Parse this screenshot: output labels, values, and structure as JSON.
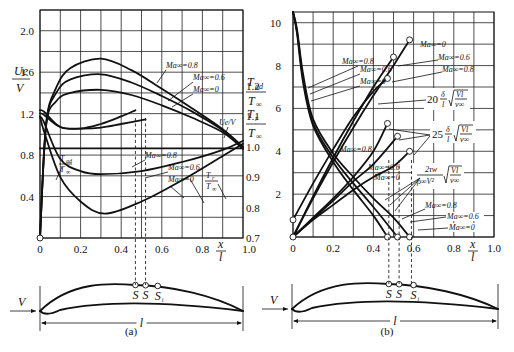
{
  "figure": {
    "panel_a_caption": "(a)",
    "panel_b_caption": "(b)",
    "airfoil": {
      "velocity_label": "V",
      "chord_label": "l",
      "point_labels": [
        "S",
        "S",
        "Sᵢ"
      ]
    }
  },
  "chart_data": [
    {
      "id": "a",
      "type": "line",
      "title": "",
      "xlabel": "x/l",
      "ylabel_left": "Ue/V",
      "ylabel_right": [
        "T_ad/T_∞",
        "T_r/T_∞"
      ],
      "xlim": [
        0,
        1.0
      ],
      "ylim_left": [
        0,
        2.2
      ],
      "ylim_right": [
        0.7,
        1.45
      ],
      "grid": true,
      "x_ticks": [
        "0",
        "0.2",
        "0.4",
        "0.6",
        "0.8",
        "1.0"
      ],
      "y_ticks_left": [
        "0.4",
        "0.8",
        "1.2",
        "1.6",
        "2.0"
      ],
      "y_ticks_right": [
        "0.7",
        "0.8",
        "0.9",
        "1.0",
        "1.1",
        "1.2"
      ],
      "series": [
        {
          "name": "Ue/V, Ma∞=0.8",
          "axis": "left",
          "x": [
            0,
            0.03,
            0.08,
            0.15,
            0.3,
            0.45,
            0.6,
            0.75,
            0.9,
            1.0
          ],
          "y": [
            0,
            1.1,
            1.45,
            1.64,
            1.73,
            1.62,
            1.44,
            1.25,
            1.05,
            0.88
          ]
        },
        {
          "name": "Ue/V, Ma∞=0.6",
          "axis": "left",
          "x": [
            0,
            0.03,
            0.08,
            0.15,
            0.3,
            0.45,
            0.6,
            0.75,
            0.9,
            1.0
          ],
          "y": [
            0,
            1.1,
            1.4,
            1.53,
            1.58,
            1.5,
            1.37,
            1.22,
            1.04,
            0.87
          ]
        },
        {
          "name": "Ue/V, Ma∞=0",
          "axis": "left",
          "x": [
            0,
            0.03,
            0.08,
            0.15,
            0.3,
            0.45,
            0.6,
            0.75,
            0.9,
            1.0
          ],
          "y": [
            0,
            1.08,
            1.32,
            1.4,
            1.43,
            1.38,
            1.28,
            1.16,
            1.02,
            0.86
          ]
        },
        {
          "name": "T_ad/T∞, Ma∞=0.8",
          "axis": "right",
          "x": [
            0,
            0.02,
            0.1,
            0.2,
            0.3,
            0.4,
            0.47
          ],
          "y": [
            1.12,
            1.115,
            1.065,
            1.06,
            1.075,
            1.1,
            1.12
          ]
        },
        {
          "name": "T_ad/T∞, Ma∞=0.6",
          "axis": "right",
          "x": [
            0,
            0.02,
            0.1,
            0.2,
            0.3,
            0.4,
            0.52
          ],
          "y": [
            1.11,
            1.105,
            1.065,
            1.06,
            1.063,
            1.075,
            1.09
          ]
        },
        {
          "name": "T_r/T∞, Ma∞=0.8",
          "axis": "right",
          "x": [
            0,
            0.02,
            0.1,
            0.2,
            0.3,
            0.5,
            0.7,
            0.9,
            1.0
          ],
          "y": [
            1.1,
            1.08,
            0.96,
            0.92,
            0.91,
            0.92,
            0.95,
            0.99,
            1.02
          ]
        },
        {
          "name": "T_r/T∞, Ma∞=0.6",
          "axis": "right",
          "x": [
            0,
            0.02,
            0.1,
            0.2,
            0.32,
            0.5,
            0.7,
            0.9,
            1.0
          ],
          "y": [
            1.1,
            1.05,
            0.9,
            0.82,
            0.78,
            0.82,
            0.89,
            0.97,
            1.01
          ]
        },
        {
          "name": "T_r/T∞, Ma∞=0",
          "axis": "right",
          "x": [
            0,
            0.5,
            1.0
          ],
          "y": [
            0.995,
            0.995,
            0.995
          ]
        }
      ],
      "annotations": [
        {
          "text": "Ma∞=0.8",
          "target": "Ue/V upper"
        },
        {
          "text": "Ma∞=0.6",
          "target": "Ue/V middle"
        },
        {
          "text": "Ma∞=0",
          "target": "Ue/V lower"
        },
        {
          "text": "Ue/V",
          "target": "Ue/V curves"
        },
        {
          "text": "T_ad/T∞",
          "target": "adiabatic temperature curves"
        },
        {
          "text": "Ma∞=0.8",
          "target": "T curve"
        },
        {
          "text": "Ma∞=0.6",
          "target": "T curve"
        },
        {
          "text": "Ma∞=0",
          "target": "T curve"
        },
        {
          "text": "T_r/T∞",
          "target": "recovery temperature curves"
        }
      ],
      "markers": {
        "separation_x": [
          0.47,
          0.52
        ]
      }
    },
    {
      "id": "b",
      "type": "line",
      "title": "",
      "xlabel": "x/l",
      "xlim": [
        0,
        1.0
      ],
      "ylim": [
        0,
        10.5
      ],
      "grid": true,
      "x_ticks": [
        "0",
        "0.2",
        "0.4",
        "0.6",
        "0.8",
        "1.0"
      ],
      "y_ticks": [
        "2",
        "4",
        "6",
        "8",
        "10"
      ],
      "series": [
        {
          "name": "20 δ*/l √(Vl/ν∞), Ma∞=0",
          "x": [
            0,
            0.1,
            0.2,
            0.3,
            0.4,
            0.5,
            0.58
          ],
          "y": [
            0,
            1.8,
            3.5,
            5.1,
            6.6,
            8.0,
            9.2
          ]
        },
        {
          "name": "20 δ*/l √(Vl/ν∞), Ma∞=0.6",
          "x": [
            0,
            0.1,
            0.2,
            0.3,
            0.4,
            0.5
          ],
          "y": [
            0,
            1.9,
            3.7,
            5.4,
            7.0,
            8.4
          ]
        },
        {
          "name": "20 δ*/l √(Vl/ν∞), Ma∞=0.8",
          "x": [
            0,
            0.1,
            0.2,
            0.3,
            0.4,
            0.47
          ],
          "y": [
            0.8,
            2.5,
            4.1,
            5.6,
            6.8,
            7.4
          ]
        },
        {
          "name": "25 δ**/l √(Vl/ν∞), Ma∞=0.8",
          "x": [
            0,
            0.1,
            0.2,
            0.3,
            0.4,
            0.47
          ],
          "y": [
            0,
            0.9,
            1.8,
            2.8,
            4.0,
            5.3
          ]
        },
        {
          "name": "25 δ**/l √(Vl/ν∞), Ma∞=0.6",
          "x": [
            0,
            0.1,
            0.2,
            0.3,
            0.4,
            0.52
          ],
          "y": [
            0,
            0.85,
            1.7,
            2.6,
            3.4,
            4.7
          ]
        },
        {
          "name": "25 δ**/l √(Vl/ν∞), Ma∞=0",
          "x": [
            0,
            0.1,
            0.2,
            0.3,
            0.4,
            0.5,
            0.58
          ],
          "y": [
            0,
            0.8,
            1.5,
            2.2,
            2.8,
            3.3,
            4.0
          ]
        },
        {
          "name": "2τw/(ρ∞V²) √(Vl/ν∞), Ma∞=0.8",
          "x": [
            0,
            0.02,
            0.05,
            0.1,
            0.2,
            0.3,
            0.4,
            0.47
          ],
          "y": [
            10.5,
            9.5,
            7.2,
            5.2,
            3.5,
            2.2,
            1.0,
            0.0
          ]
        },
        {
          "name": "2τw/(ρ∞V²) √(Vl/ν∞), Ma∞=0.6",
          "x": [
            0,
            0.02,
            0.05,
            0.1,
            0.2,
            0.3,
            0.4,
            0.52
          ],
          "y": [
            10.5,
            9.6,
            7.4,
            5.3,
            3.7,
            2.5,
            1.4,
            0.0
          ]
        },
        {
          "name": "2τw/(ρ∞V²) √(Vl/ν∞), Ma∞=0",
          "x": [
            0,
            0.02,
            0.05,
            0.1,
            0.2,
            0.3,
            0.4,
            0.5,
            0.58
          ],
          "y": [
            10.5,
            9.7,
            7.6,
            5.5,
            3.9,
            2.8,
            1.8,
            0.9,
            0.0
          ]
        }
      ],
      "annotations": [
        {
          "text": "Ma∞=0.8"
        },
        {
          "text": "Ma∞=0.6"
        },
        {
          "text": "Ma∞=0"
        },
        {
          "text": "Ma∞=0"
        },
        {
          "text": "Ma∞=0.6"
        },
        {
          "text": "Ma∞=0.8"
        },
        {
          "text": "20 δ*/l √(Vl/ν∞)"
        },
        {
          "text": "25 δ**/l √(Vl/ν∞)"
        },
        {
          "text": "Ma∞=0.8"
        },
        {
          "text": "Ma∞=0.6"
        },
        {
          "text": "Ma∞=0"
        },
        {
          "text": "2τw/(ρ∞V²) √(Vl/ν∞)"
        },
        {
          "text": "Ma∞=0.8"
        },
        {
          "text": "Ma∞=0.6"
        },
        {
          "text": "Ma∞=0"
        }
      ],
      "markers": {
        "separation_x": [
          0.47,
          0.52,
          0.58
        ]
      }
    }
  ],
  "labels": {
    "ma08": "Ma∞=0.8",
    "ma06": "Ma∞=0.6",
    "ma0": "Ma∞=0",
    "uev": "Ue/V",
    "ue": "Ue",
    "v": "V",
    "tad": "T",
    "tad_sub": "ad",
    "tinf": "T",
    "tinf_sub": "∞",
    "tr": "T",
    "tr_sub": "r",
    "x": "x",
    "l": "l",
    "f20": "20",
    "f25": "25",
    "delta_star": "δ",
    "sqrt_num": "Vl",
    "sqrt_den": "ν∞",
    "tau_num": "2τw",
    "tau_den": "ρ∞V²"
  }
}
